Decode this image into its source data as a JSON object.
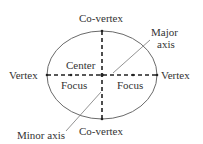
{
  "diagram": {
    "labels": {
      "covertex_top": "Co-vertex",
      "covertex_bottom": "Co-vertex",
      "vertex_left": "Vertex",
      "vertex_right": "Vertex",
      "center": "Center",
      "focus_left": "Focus",
      "focus_right": "Focus",
      "major_axis_line1": "Major",
      "major_axis_line2": "axis",
      "minor_axis": "Minor axis"
    },
    "colors": {
      "stroke": "#555555",
      "text": "#333333"
    }
  }
}
